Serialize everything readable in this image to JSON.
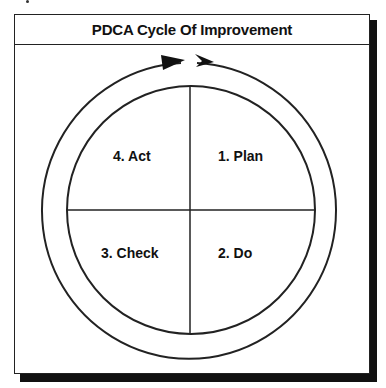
{
  "diagram": {
    "title": "PDCA Cycle Of Improvement",
    "quadrants": [
      {
        "position": "top-right",
        "label": "1. Plan"
      },
      {
        "position": "bottom-right",
        "label": "2. Do"
      },
      {
        "position": "bottom-left",
        "label": "3. Check"
      },
      {
        "position": "top-left",
        "label": "4. Act"
      }
    ],
    "cycle_direction": "clockwise",
    "colors": {
      "line": "#222222",
      "background": "#ffffff",
      "shadow": "#111111"
    }
  }
}
